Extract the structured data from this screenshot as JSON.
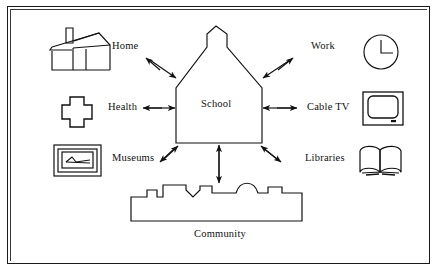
{
  "diagram": {
    "center": {
      "label": "School",
      "shape": "schoolhouse-with-belfry"
    },
    "bottom": {
      "label": "Community",
      "shape": "town-skyline"
    },
    "nodes": [
      {
        "id": "home",
        "label": "Home",
        "icon": "house-icon",
        "position": "top-left",
        "arrow": "bidirectional-diagonal"
      },
      {
        "id": "work",
        "label": "Work",
        "icon": "clock-icon",
        "position": "top-right",
        "arrow": "bidirectional-diagonal"
      },
      {
        "id": "health",
        "label": "Health",
        "icon": "medical-cross-icon",
        "position": "middle-left",
        "arrow": "bidirectional-horizontal"
      },
      {
        "id": "cable-tv",
        "label": "Cable TV",
        "icon": "television-icon",
        "position": "middle-right",
        "arrow": "bidirectional-horizontal"
      },
      {
        "id": "museums",
        "label": "Museums",
        "icon": "framed-picture-icon",
        "position": "bottom-left",
        "arrow": "bidirectional-diagonal"
      },
      {
        "id": "libraries",
        "label": "Libraries",
        "icon": "open-book-icon",
        "position": "bottom-right",
        "arrow": "bidirectional-diagonal"
      }
    ],
    "connector_community": "bidirectional-vertical",
    "colors": {
      "ink": "#111111",
      "frame": "#1a1a1a",
      "background": "#ffffff"
    }
  }
}
